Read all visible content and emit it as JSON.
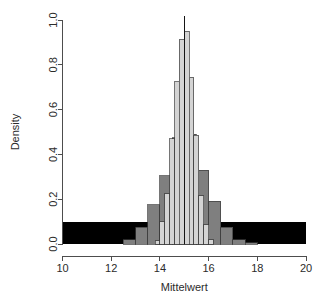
{
  "chart_data": {
    "type": "bar",
    "title": "",
    "subtitle": "",
    "xlabel": "Mittelwert",
    "ylabel": "Density",
    "xlim": [
      10,
      20
    ],
    "ylim": [
      0.0,
      1.0
    ],
    "xticks": [
      10,
      12,
      14,
      16,
      18,
      20
    ],
    "xtick_labels": [
      "10",
      "12",
      "14",
      "16",
      "18",
      "20"
    ],
    "yticks": [
      0.0,
      0.2,
      0.4,
      0.6,
      0.8,
      1.0
    ],
    "ytick_labels": [
      "0.0",
      "0.2",
      "0.4",
      "0.6",
      "0.8",
      "1.0"
    ],
    "grid": false,
    "legend": null,
    "annotations": [
      {
        "name": "mean-reference-line",
        "type": "vline",
        "x": 15.0,
        "color": "#151515"
      }
    ],
    "series": [
      {
        "name": "Uniform population density",
        "color": "#000000",
        "bin_width": 10.0,
        "bins": [
          {
            "x0": 10.0,
            "x1": 20.0,
            "value": 0.1
          }
        ]
      },
      {
        "name": "Sampling distribution n small",
        "color": "#7f7f7f",
        "bin_width": 0.5,
        "bins": [
          {
            "x0": 12.5,
            "x1": 13.0,
            "value": 0.02
          },
          {
            "x0": 13.0,
            "x1": 13.5,
            "value": 0.075
          },
          {
            "x0": 13.5,
            "x1": 14.0,
            "value": 0.175
          },
          {
            "x0": 14.0,
            "x1": 14.5,
            "value": 0.305
          },
          {
            "x0": 14.5,
            "x1": 15.0,
            "value": 0.475
          },
          {
            "x0": 15.0,
            "x1": 15.5,
            "value": 0.49
          },
          {
            "x0": 15.5,
            "x1": 16.0,
            "value": 0.33
          },
          {
            "x0": 16.0,
            "x1": 16.5,
            "value": 0.19
          },
          {
            "x0": 16.5,
            "x1": 17.0,
            "value": 0.075
          },
          {
            "x0": 17.0,
            "x1": 17.5,
            "value": 0.02
          },
          {
            "x0": 17.5,
            "x1": 18.0,
            "value": 0.006
          }
        ]
      },
      {
        "name": "Sampling distribution n large",
        "color": "#d4d4d4",
        "bin_width": 0.2,
        "bins": [
          {
            "x0": 13.8,
            "x1": 14.0,
            "value": 0.015
          },
          {
            "x0": 14.0,
            "x1": 14.2,
            "value": 0.1
          },
          {
            "x0": 14.2,
            "x1": 14.4,
            "value": 0.225
          },
          {
            "x0": 14.4,
            "x1": 14.6,
            "value": 0.47
          },
          {
            "x0": 14.6,
            "x1": 14.8,
            "value": 0.725
          },
          {
            "x0": 14.8,
            "x1": 15.0,
            "value": 0.915
          },
          {
            "x0": 15.0,
            "x1": 15.2,
            "value": 0.95
          },
          {
            "x0": 15.2,
            "x1": 15.4,
            "value": 0.745
          },
          {
            "x0": 15.4,
            "x1": 15.6,
            "value": 0.485
          },
          {
            "x0": 15.6,
            "x1": 15.8,
            "value": 0.215
          },
          {
            "x0": 15.8,
            "x1": 16.0,
            "value": 0.085
          },
          {
            "x0": 16.0,
            "x1": 16.2,
            "value": 0.02
          }
        ]
      }
    ]
  },
  "axes": {
    "x_title": "Mittelwert",
    "y_title": "Density"
  }
}
